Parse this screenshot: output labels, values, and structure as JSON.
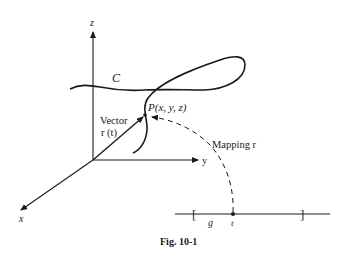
{
  "figure": {
    "caption": "Fig. 10-1",
    "axes": {
      "z_label": "z",
      "y_label": "y",
      "x_label": "x"
    },
    "curve_label": "C",
    "point_label": "P(x, y, z)",
    "vector_label_line1": "Vector",
    "vector_label_line2": "r (t)",
    "mapping_label": "Mapping r",
    "interval_label": "g",
    "parameter_label": "t",
    "interval_open_bracket": "[",
    "interval_close_bracket": "]"
  },
  "colors": {
    "ink": "#1a1a1a",
    "background": "#ffffff"
  }
}
